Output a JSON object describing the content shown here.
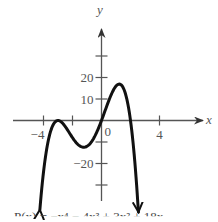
{
  "chart_data": {
    "type": "line",
    "title": "",
    "caption": "P(x) = −x⁴ − 4x³ + 3x² + 18x",
    "xlabel": "x",
    "ylabel": "y",
    "x_ticks": [
      -4,
      -2,
      4
    ],
    "x_tick_labels": {
      "-4": "−4",
      "4": "4"
    },
    "origin_label": "0",
    "y_ticks": [
      -30,
      -20,
      -10,
      10,
      20,
      30
    ],
    "y_tick_labels": {
      "20": "20",
      "10": "10",
      "-20": "−20"
    },
    "xlim": [
      -5.5,
      6.3
    ],
    "ylim": [
      -42,
      52
    ],
    "grid": false,
    "series": [
      {
        "name": "P(x)",
        "formula": "-x^4 - 4x^3 + 3x^2 + 18x",
        "x_range": [
          -4.25,
          2.55
        ],
        "end_arrows": true,
        "key_points": [
          {
            "x": -3,
            "y": 0,
            "note": "double root / local max"
          },
          {
            "x": -1.3,
            "y": -12.4,
            "note": "local min"
          },
          {
            "x": 0,
            "y": 0,
            "note": "root"
          },
          {
            "x": 1.3,
            "y": 16.8,
            "note": "local max"
          },
          {
            "x": 2,
            "y": 0,
            "note": "root"
          }
        ]
      }
    ]
  },
  "colors": {
    "axis": "#555555",
    "curve": "#111111",
    "text": "#555555"
  },
  "layout": {
    "origin_px": [
      101.5,
      120.5
    ],
    "px_per_x": 14.5,
    "px_per_y": 2.15
  }
}
